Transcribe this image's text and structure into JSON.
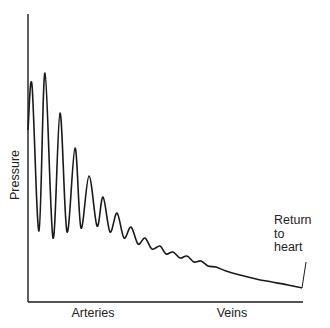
{
  "chart_data": {
    "type": "line",
    "title": "",
    "xlabel": "",
    "ylabel": "Pressure",
    "x_regions": [
      "Arteries",
      "Veins"
    ],
    "annotation": "Return to heart",
    "grid": false,
    "legend": null,
    "points_px": [
      [
        28,
        130
      ],
      [
        32,
        85
      ],
      [
        39,
        231
      ],
      [
        45,
        73
      ],
      [
        53,
        238
      ],
      [
        60,
        113
      ],
      [
        67,
        232
      ],
      [
        75,
        148
      ],
      [
        81,
        228
      ],
      [
        89,
        176
      ],
      [
        97,
        226
      ],
      [
        103,
        197
      ],
      [
        110,
        232
      ],
      [
        117,
        213
      ],
      [
        124,
        238
      ],
      [
        131,
        227
      ],
      [
        138,
        244
      ],
      [
        145,
        238
      ],
      [
        152,
        249
      ],
      [
        160,
        246
      ],
      [
        166,
        254
      ],
      [
        173,
        252
      ],
      [
        180,
        258
      ],
      [
        187,
        256
      ],
      [
        194,
        262
      ],
      [
        201,
        261
      ],
      [
        208,
        266
      ],
      [
        216,
        267
      ],
      [
        226,
        271
      ],
      [
        240,
        275
      ],
      [
        256,
        279
      ],
      [
        272,
        282
      ],
      [
        288,
        285
      ],
      [
        302,
        288
      ]
    ],
    "axis": {
      "x0": 28,
      "y0": 302,
      "x1": 303,
      "ytop": 14
    },
    "annotation_leader": {
      "x1": 302,
      "y1": 288,
      "x2": 306,
      "y2": 262
    }
  },
  "labels": {
    "y_axis": "Pressure",
    "x_left": "Arteries",
    "x_right": "Veins",
    "note_line1": "Return",
    "note_line2": "to",
    "note_line3": "heart"
  },
  "colors": {
    "line": "#1a1a1a",
    "text": "#222222",
    "background": "#ffffff"
  }
}
